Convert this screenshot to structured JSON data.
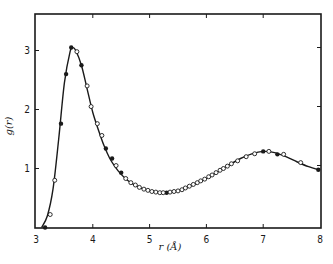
{
  "chart_data": {
    "type": "line",
    "title": "",
    "xlabel": "r (Å)",
    "ylabel": "g(r)",
    "xlim": [
      3,
      8
    ],
    "ylim": [
      0,
      3.6
    ],
    "x_ticks": [
      3,
      4,
      5,
      6,
      7,
      8
    ],
    "y_ticks": [
      1,
      2,
      3
    ],
    "grid": false,
    "legend": null,
    "series": [
      {
        "name": "curve",
        "style": "solid-line",
        "x": [
          3.1,
          3.2,
          3.3,
          3.4,
          3.5,
          3.6,
          3.65,
          3.7,
          3.8,
          3.9,
          4.0,
          4.1,
          4.2,
          4.3,
          4.4,
          4.5,
          4.6,
          4.7,
          4.8,
          4.9,
          5.0,
          5.1,
          5.2,
          5.3,
          5.4,
          5.5,
          5.6,
          5.7,
          5.8,
          5.9,
          6.0,
          6.2,
          6.4,
          6.6,
          6.8,
          7.0,
          7.2,
          7.4,
          7.6,
          7.8,
          8.0
        ],
        "y": [
          0.0,
          0.2,
          0.65,
          1.5,
          2.45,
          2.98,
          3.05,
          3.0,
          2.75,
          2.35,
          1.95,
          1.65,
          1.38,
          1.17,
          1.02,
          0.9,
          0.81,
          0.74,
          0.69,
          0.65,
          0.62,
          0.6,
          0.59,
          0.59,
          0.6,
          0.62,
          0.65,
          0.69,
          0.73,
          0.78,
          0.83,
          0.94,
          1.06,
          1.17,
          1.25,
          1.29,
          1.27,
          1.2,
          1.11,
          1.03,
          0.97
        ]
      },
      {
        "name": "filled points",
        "style": "filled-circle",
        "x": [
          3.16,
          3.44,
          3.53,
          3.62,
          3.8,
          4.23,
          4.34,
          4.5,
          5.3,
          7.0,
          7.25,
          7.97
        ],
        "y": [
          0.0,
          1.76,
          2.6,
          3.05,
          2.75,
          1.34,
          1.17,
          0.93,
          0.59,
          1.29,
          1.24,
          0.98
        ]
      },
      {
        "name": "open points",
        "style": "open-circle",
        "x": [
          3.25,
          3.33,
          3.72,
          3.9,
          3.97,
          4.08,
          4.16,
          4.41,
          4.58,
          4.67,
          4.75,
          4.82,
          4.9,
          4.97,
          5.04,
          5.11,
          5.18,
          5.24,
          5.36,
          5.43,
          5.5,
          5.57,
          5.63,
          5.7,
          5.77,
          5.84,
          5.9,
          5.97,
          6.04,
          6.1,
          6.17,
          6.24,
          6.3,
          6.37,
          6.44,
          6.55,
          6.7,
          6.85,
          7.1,
          7.36,
          7.66
        ],
        "y": [
          0.22,
          0.8,
          2.98,
          2.4,
          2.05,
          1.76,
          1.56,
          1.05,
          0.83,
          0.76,
          0.72,
          0.68,
          0.65,
          0.63,
          0.61,
          0.6,
          0.59,
          0.59,
          0.6,
          0.61,
          0.62,
          0.64,
          0.67,
          0.7,
          0.73,
          0.76,
          0.79,
          0.82,
          0.86,
          0.89,
          0.93,
          0.97,
          1.0,
          1.04,
          1.08,
          1.13,
          1.2,
          1.25,
          1.29,
          1.24,
          1.1
        ]
      }
    ]
  },
  "axes": {
    "x_tick_labels": [
      "3",
      "4",
      "5",
      "6",
      "7",
      "8"
    ],
    "y_tick_labels": [
      "1",
      "2",
      "3"
    ],
    "xlabel": "r (Å)",
    "ylabel": "g(r)"
  }
}
